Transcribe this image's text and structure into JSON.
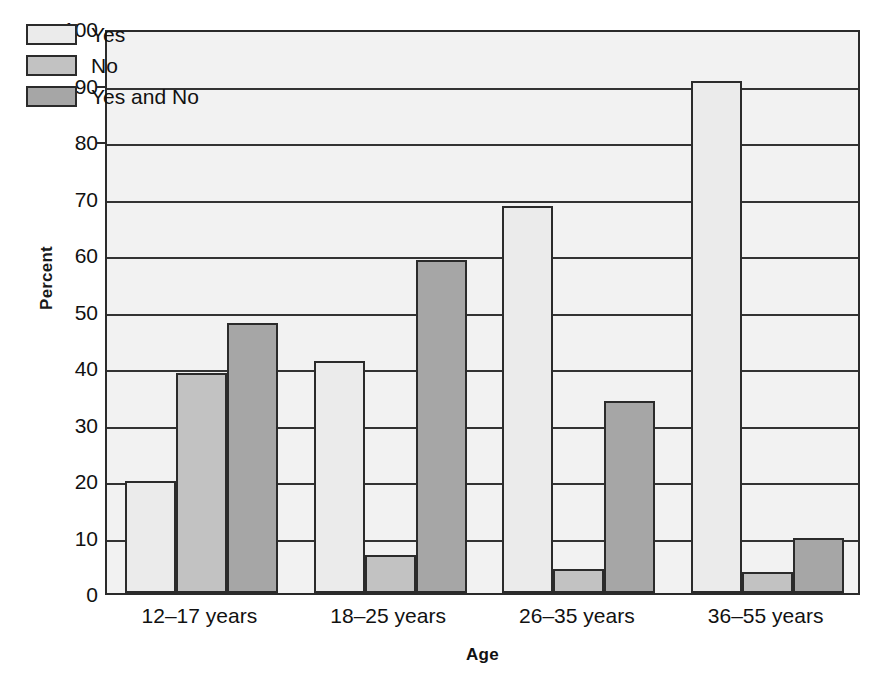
{
  "chart_data": {
    "type": "bar",
    "title": "",
    "xlabel": "Age",
    "ylabel": "Percent",
    "categories": [
      "12–17 years",
      "18–25 years",
      "26–35 years",
      "36–55 years"
    ],
    "series": [
      {
        "name": "Yes",
        "color": "#ebebeb",
        "values": [
          19.8,
          41.0,
          68.5,
          90.6
        ]
      },
      {
        "name": "No",
        "color": "#c2c2c2",
        "values": [
          38.9,
          6.7,
          4.2,
          3.7
        ]
      },
      {
        "name": "Yes and No",
        "color": "#a6a6a6",
        "values": [
          47.8,
          59.0,
          34.0,
          9.7
        ]
      }
    ],
    "ylim": [
      0,
      100
    ],
    "ytick_labels": [
      "0",
      "10",
      "20",
      "30",
      "40",
      "50",
      "60",
      "70",
      "80",
      "90",
      "100"
    ],
    "ytick_values": [
      0,
      10,
      20,
      30,
      40,
      50,
      60,
      70,
      80,
      90,
      100
    ],
    "grid": true,
    "grid_axis": "y",
    "legend_position": "top-left",
    "plot_background": "#f2f2f2",
    "axis_color": "#2b2b2b"
  }
}
